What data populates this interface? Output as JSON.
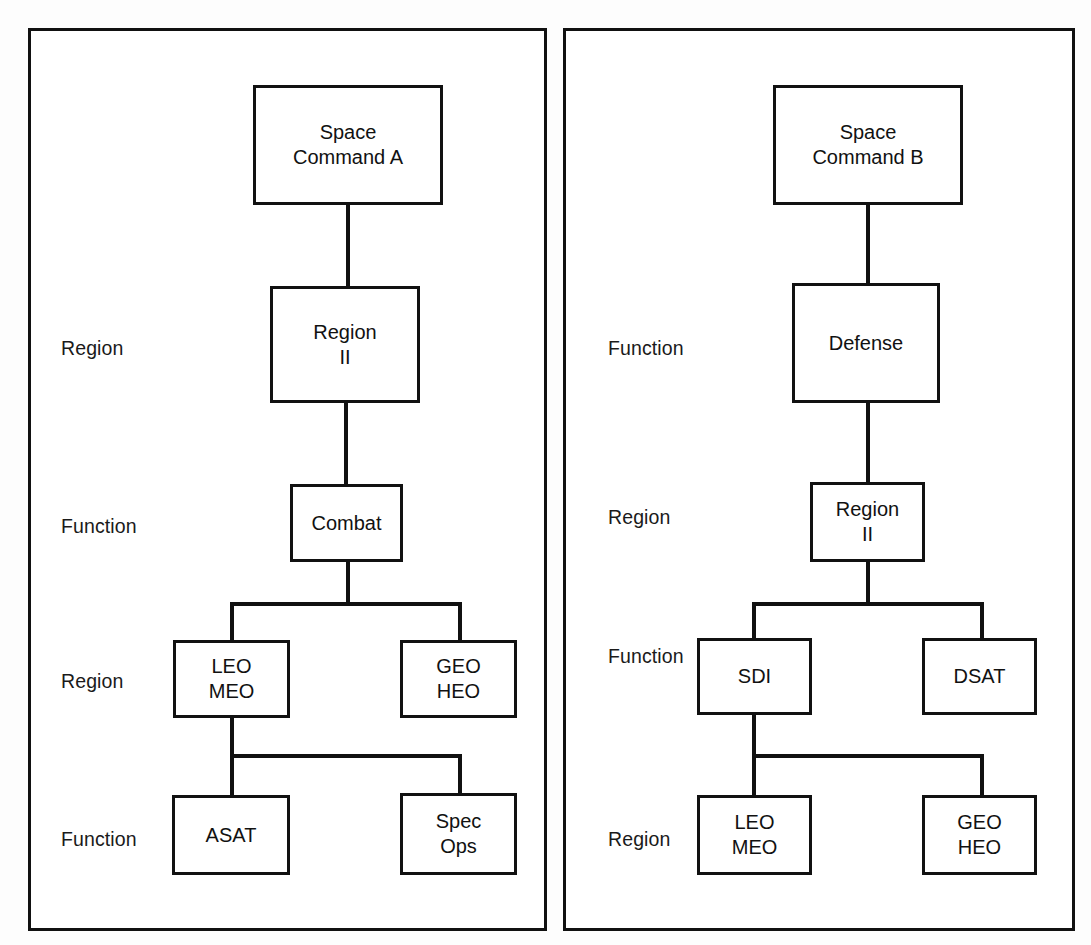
{
  "diagram": {
    "type": "org-chart-comparison",
    "panels": [
      {
        "id": "panel-a",
        "labels": [
          {
            "text": "Region",
            "x": 61,
            "y": 337
          },
          {
            "text": "Function",
            "x": 61,
            "y": 515
          },
          {
            "text": "Region",
            "x": 61,
            "y": 670
          },
          {
            "text": "Function",
            "x": 61,
            "y": 828
          }
        ],
        "nodes": [
          {
            "id": "space-command-a",
            "text": "Space\nCommand A",
            "x": 253,
            "y": 85,
            "w": 190,
            "h": 120
          },
          {
            "id": "region-ii",
            "text": "Region\nII",
            "x": 270,
            "y": 286,
            "w": 150,
            "h": 117
          },
          {
            "id": "combat",
            "text": "Combat",
            "x": 290,
            "y": 484,
            "w": 113,
            "h": 78
          },
          {
            "id": "leo-meo",
            "text": "LEO\nMEO",
            "x": 173,
            "y": 640,
            "w": 117,
            "h": 78
          },
          {
            "id": "geo-heo",
            "text": "GEO\nHEO",
            "x": 400,
            "y": 640,
            "w": 117,
            "h": 78
          },
          {
            "id": "asat",
            "text": "ASAT",
            "x": 172,
            "y": 795,
            "w": 118,
            "h": 80
          },
          {
            "id": "spec-ops",
            "text": "Spec\nOps",
            "x": 400,
            "y": 793,
            "w": 117,
            "h": 82
          }
        ]
      },
      {
        "id": "panel-b",
        "labels": [
          {
            "text": "Function",
            "x": 608,
            "y": 337
          },
          {
            "text": "Region",
            "x": 608,
            "y": 506
          },
          {
            "text": "Function",
            "x": 608,
            "y": 645
          },
          {
            "text": "Region",
            "x": 608,
            "y": 828
          }
        ],
        "nodes": [
          {
            "id": "space-command-b",
            "text": "Space\nCommand B",
            "x": 773,
            "y": 85,
            "w": 190,
            "h": 120
          },
          {
            "id": "defense",
            "text": "Defense",
            "x": 792,
            "y": 283,
            "w": 148,
            "h": 120
          },
          {
            "id": "region-ii-b",
            "text": "Region\nII",
            "x": 810,
            "y": 482,
            "w": 115,
            "h": 80
          },
          {
            "id": "sdi",
            "text": "SDI",
            "x": 697,
            "y": 638,
            "w": 115,
            "h": 77
          },
          {
            "id": "dsat",
            "text": "DSAT",
            "x": 922,
            "y": 638,
            "w": 115,
            "h": 77
          },
          {
            "id": "leo-meo-b",
            "text": "LEO\nMEO",
            "x": 697,
            "y": 795,
            "w": 115,
            "h": 80
          },
          {
            "id": "geo-heo-b",
            "text": "GEO\nHEO",
            "x": 922,
            "y": 795,
            "w": 115,
            "h": 80
          }
        ]
      }
    ],
    "connectors": [
      {
        "id": "a-sc-to-region",
        "type": "v",
        "x": 346,
        "y": 205,
        "len": 83
      },
      {
        "id": "a-region-to-combat",
        "type": "v",
        "x": 344,
        "y": 403,
        "len": 83
      },
      {
        "id": "a-combat-down",
        "type": "v",
        "x": 346,
        "y": 562,
        "len": 44
      },
      {
        "id": "a-split-bar",
        "type": "h",
        "x": 230,
        "y": 602,
        "len": 232
      },
      {
        "id": "a-split-left",
        "type": "v",
        "x": 230,
        "y": 602,
        "len": 40
      },
      {
        "id": "a-split-right",
        "type": "v",
        "x": 458,
        "y": 602,
        "len": 40
      },
      {
        "id": "a-leo-down",
        "type": "v",
        "x": 230,
        "y": 718,
        "len": 40
      },
      {
        "id": "a-split2-bar",
        "type": "h",
        "x": 230,
        "y": 754,
        "len": 232
      },
      {
        "id": "a-split2-left",
        "type": "v",
        "x": 230,
        "y": 754,
        "len": 44
      },
      {
        "id": "a-split2-right",
        "type": "v",
        "x": 458,
        "y": 754,
        "len": 42
      },
      {
        "id": "b-sc-to-defense",
        "type": "v",
        "x": 866,
        "y": 205,
        "len": 80
      },
      {
        "id": "b-defense-to-reg",
        "type": "v",
        "x": 866,
        "y": 403,
        "len": 81
      },
      {
        "id": "b-region-down",
        "type": "v",
        "x": 866,
        "y": 562,
        "len": 42
      },
      {
        "id": "b-split-bar",
        "type": "h",
        "x": 752,
        "y": 602,
        "len": 232
      },
      {
        "id": "b-split-left",
        "type": "v",
        "x": 752,
        "y": 602,
        "len": 38
      },
      {
        "id": "b-split-right",
        "type": "v",
        "x": 980,
        "y": 602,
        "len": 38
      },
      {
        "id": "b-sdi-down",
        "type": "v",
        "x": 752,
        "y": 715,
        "len": 42
      },
      {
        "id": "b-split2-bar",
        "type": "h",
        "x": 752,
        "y": 754,
        "len": 232
      },
      {
        "id": "b-split2-left",
        "type": "v",
        "x": 752,
        "y": 754,
        "len": 43
      },
      {
        "id": "b-split2-right",
        "type": "v",
        "x": 980,
        "y": 754,
        "len": 43
      }
    ]
  },
  "colors": {
    "line": "#111111",
    "background": "#ffffff"
  }
}
